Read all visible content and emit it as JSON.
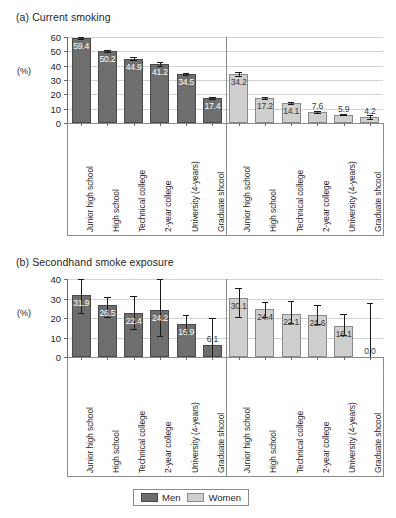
{
  "figure": {
    "ylabel": "(%)",
    "legend": {
      "men": "Men",
      "women": "Women"
    }
  },
  "chart_data": [
    {
      "type": "bar",
      "title": "(a) Current smoking",
      "panel": "a",
      "xlabel": "",
      "ylabel": "(%)",
      "ylim": [
        0,
        60
      ],
      "yticks": [
        0,
        10,
        20,
        30,
        40,
        50,
        60
      ],
      "grid": true,
      "legend_position": "bottom",
      "categories": [
        "Junior high school",
        "High school",
        "Technical college",
        "2-year college",
        "University (4-years)",
        "Graduate shcool"
      ],
      "series": [
        {
          "name": "Men",
          "color": "#6e6e6e",
          "values": [
            59.4,
            50.2,
            44.9,
            41.2,
            34.5,
            17.4
          ],
          "errors": [
            0.8,
            0.7,
            0.8,
            1.2,
            0.7,
            0.9
          ]
        },
        {
          "name": "Women",
          "color": "#cfcfcf",
          "values": [
            34.2,
            17.2,
            14.1,
            7.6,
            5.9,
            4.2
          ],
          "errors": [
            1.5,
            0.6,
            0.8,
            0.5,
            0.6,
            1.4
          ]
        }
      ]
    },
    {
      "type": "bar",
      "title": "(b) Secondhand smoke exposure",
      "panel": "b",
      "xlabel": "",
      "ylabel": "(%)",
      "ylim": [
        0,
        40
      ],
      "yticks": [
        0,
        10,
        20,
        30,
        40
      ],
      "grid": true,
      "legend_position": "bottom",
      "categories": [
        "Junior high school",
        "High school",
        "Technical college",
        "2-year college",
        "University (4-years)",
        "Graduate shcool"
      ],
      "series": [
        {
          "name": "Men",
          "color": "#6e6e6e",
          "values": [
            31.9,
            26.5,
            22.4,
            24.2,
            16.9,
            6.1
          ],
          "errors_low": [
            9.5,
            6.0,
            8.0,
            13.5,
            4.5,
            6.1
          ],
          "errors_high": [
            8.5,
            4.3,
            9.0,
            18.0,
            4.6,
            14.0
          ]
        },
        {
          "name": "Women",
          "color": "#cfcfcf",
          "values": [
            30.1,
            24.4,
            22.1,
            21.6,
            16.1,
            0.0
          ],
          "errors_low": [
            9.5,
            4.0,
            4.5,
            4.5,
            5.0,
            0.0
          ],
          "errors_high": [
            5.5,
            3.8,
            6.8,
            5.2,
            6.0,
            27.5
          ]
        }
      ]
    }
  ]
}
